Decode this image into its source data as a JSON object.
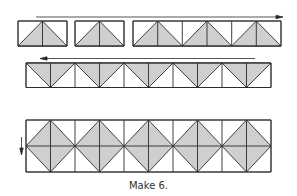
{
  "caption": "Make 6.",
  "colors": {
    "fill": "#cfcfcf",
    "stroke": "#2a2a2a",
    "background": "#ffffff"
  },
  "row1": {
    "description": "Flying-geese units sewn in sequence, arrow pointing right",
    "units": 5,
    "arrow_direction": "right"
  },
  "row2": {
    "description": "Strip of joined inverted flying-geese units, arrow pointing left",
    "units": 5,
    "arrow_direction": "left"
  },
  "row3": {
    "description": "Two strips joined forming square-in-square diamonds, arrow pointing down",
    "diamonds": 5,
    "arrow_direction": "down"
  }
}
